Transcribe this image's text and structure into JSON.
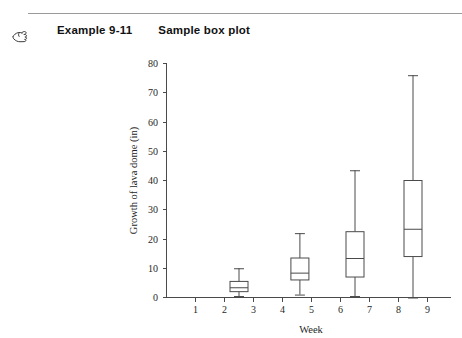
{
  "header": {
    "icon": "manicule-pointing-hand-icon",
    "example_label": "Example 9-11",
    "title": "Sample box plot"
  },
  "chart_data": {
    "type": "box",
    "title": "Sample box plot",
    "xlabel": "Week",
    "ylabel": "Growth of lava dome (in)",
    "xlim": [
      0,
      9.8
    ],
    "ylim": [
      0,
      80
    ],
    "xticks": [
      1,
      2,
      3,
      4,
      5,
      6,
      7,
      8,
      9
    ],
    "xtick_labels": [
      "1",
      "2",
      "3",
      "4",
      "5",
      "6",
      "7",
      "8",
      "9"
    ],
    "yticks": [
      0,
      10,
      20,
      30,
      40,
      50,
      60,
      70,
      80
    ],
    "ytick_labels": [
      "0",
      "10",
      "20",
      "30",
      "40",
      "50",
      "60",
      "70",
      "80"
    ],
    "grid": false,
    "legend": false,
    "boxes": [
      {
        "name": "box-week-2-3",
        "x": 2.5,
        "whisker_low": 0.5,
        "q1": 2.0,
        "median": 3.5,
        "q3": 5.5,
        "whisker_high": 10.0
      },
      {
        "name": "box-week-4-5",
        "x": 4.6,
        "whisker_low": 1.0,
        "q1": 6.0,
        "median": 8.5,
        "q3": 13.5,
        "whisker_high": 22.0
      },
      {
        "name": "box-week-6-7",
        "x": 6.5,
        "whisker_low": 0.5,
        "q1": 7.0,
        "median": 13.5,
        "q3": 22.5,
        "whisker_high": 43.5
      },
      {
        "name": "box-week-8-9",
        "x": 8.5,
        "whisker_low": 0.0,
        "q1": 14.0,
        "median": 23.5,
        "q3": 40.0,
        "whisker_high": 76.0
      }
    ]
  },
  "colors": {
    "ink": "#1a1a1a",
    "axis": "#4a4a4a",
    "rule": "#9a9a9a",
    "background": "#ffffff"
  }
}
